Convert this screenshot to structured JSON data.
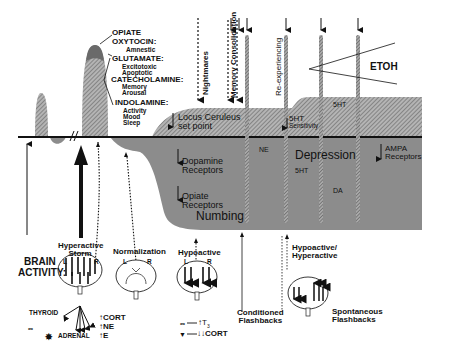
{
  "diagram": {
    "peak_labels": {
      "opiate": "OPIATE",
      "oxytocin": "OXYTOCIN:",
      "oxytocin_effect": "Amnestic",
      "glutamate": "GLUTAMATE:",
      "glutamate_effects": [
        "Excitotoxic",
        "Apoptotic"
      ],
      "catecholamine": "CATECHOLAMINE:",
      "catecholamine_effects": [
        "Memory",
        "Arousal"
      ],
      "indolamine": "INDOLAMINE:",
      "indolamine_effects": [
        "Activity",
        "Mood",
        "Sleep"
      ]
    },
    "top_arrows": {
      "nightmares": "Nightmares",
      "memory_consolidation": "Memory Consolidation",
      "reexperiencing": "Re-experiencing"
    },
    "etoh": "ETOH",
    "upper_region": {
      "locus_ceruleus": [
        "Locus Ceruleus",
        "set point"
      ],
      "fivehT_sensitivity": [
        "5HT",
        "Sensitivity"
      ],
      "fivehT_up": "5HT"
    },
    "lower_region": {
      "dopamine": [
        "Dopamine",
        "Receptors"
      ],
      "opiate": [
        "Opiate",
        "Receptors"
      ],
      "numbing": "Numbing",
      "ne": "NE",
      "depression": "Depression",
      "fivehT_down": "5HT",
      "da": "DA",
      "ampa": [
        "AMPA",
        "Receptors"
      ]
    },
    "brain_activity": {
      "label": [
        "BRAIN",
        "ACTIVITY:"
      ],
      "states": [
        {
          "name": [
            "Hyperactive",
            "Storm"
          ],
          "L": "L",
          "R": "R"
        },
        {
          "name": [
            "Normalization"
          ],
          "L": "L",
          "R": "R"
        },
        {
          "name": [
            "Hypoactive"
          ],
          "L": "L",
          "R": "R"
        },
        {
          "name": [
            "Hypoactive/",
            "Hyperactive"
          ]
        }
      ]
    },
    "hormones": {
      "thyroid": "THYROID",
      "adrenal": "ADRENAL",
      "cort": "CORT",
      "ne": "NE",
      "e": "E",
      "t3": "T",
      "t3_sub": "3",
      "cort_low": "CORT"
    },
    "flashbacks": {
      "conditioned": [
        "Conditioned",
        "Flashbacks"
      ],
      "spontaneous": [
        "Spontaneous",
        "Flashbacks"
      ]
    },
    "colors": {
      "hatch_fill": "#9a9a9a",
      "lower_fill": "#8c8c8c",
      "peak_top": "#6a6a6a",
      "line": "#111111"
    }
  }
}
